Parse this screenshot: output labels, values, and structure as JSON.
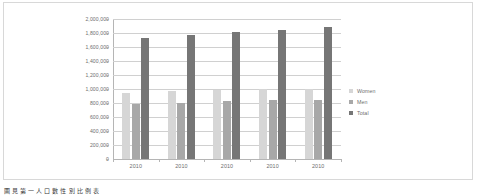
{
  "caption": "圖 見 第 一 人 口 數 性 別 比 例 表",
  "legend": {
    "position": "right",
    "entries": [
      {
        "name": "women-legend",
        "label": "Women",
        "color": "#d6d6d6"
      },
      {
        "name": "men-legend",
        "label": "Men",
        "color": "#a8a8a8"
      },
      {
        "name": "total-legend",
        "label": "Total",
        "color": "#767676"
      }
    ]
  },
  "chart_data": {
    "type": "bar",
    "title": "",
    "subtitle": "",
    "xlabel": "",
    "ylabel": "",
    "categories": [
      "2010",
      "2010",
      "2010",
      "2010",
      "2010"
    ],
    "series": [
      {
        "name": "Women",
        "color": "#d6d6d6",
        "values": [
          950000,
          965000,
          985000,
          998000,
          1003000
        ]
      },
      {
        "name": "Men",
        "color": "#a8a8a8",
        "values": [
          790000,
          800000,
          822000,
          838000,
          845000
        ]
      },
      {
        "name": "Total",
        "color": "#767676",
        "values": [
          1730000,
          1772000,
          1812000,
          1842000,
          1885000
        ]
      }
    ],
    "ylim": [
      0,
      2000000
    ],
    "ytick_step": 200000,
    "ytick_labels": [
      "2,000,000",
      "1,800,000",
      "1,600,000",
      "1,400,000",
      "1,200,000",
      "1,000,000",
      "800,000",
      "600,000",
      "400,000",
      "200,000",
      "0"
    ],
    "ytick_values": [
      2000000,
      1800000,
      1600000,
      1400000,
      1200000,
      1000000,
      800000,
      600000,
      400000,
      200000,
      0
    ],
    "grid": true,
    "grid_axis": "y",
    "legend_position": "right",
    "background": "#ffffff",
    "plot_border_color": "#b5b5b5",
    "grid_color": "#d0d0d0",
    "tick_label_color": "#6e6e6e"
  }
}
